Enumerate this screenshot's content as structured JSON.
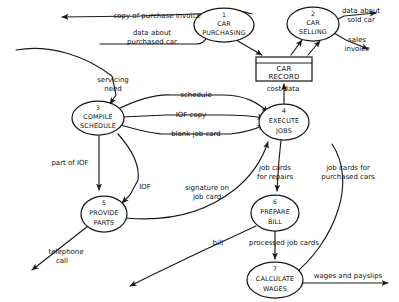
{
  "diagram": {
    "type": "data-flow-diagram",
    "background_color": "#ffffff",
    "ink_color": "#1a1a1a"
  },
  "processes": [
    {
      "id": "p1",
      "number": "1",
      "lines": [
        "CAR",
        "PURCHASING"
      ],
      "cx": 224,
      "cy": 25,
      "rx": 30,
      "ry": 17
    },
    {
      "id": "p2",
      "number": "2",
      "lines": [
        "CAR",
        "SELLING"
      ],
      "cx": 313,
      "cy": 24,
      "rx": 26,
      "ry": 17
    },
    {
      "id": "p3",
      "number": "3",
      "lines": [
        "COMPILE",
        "SCHEDULE"
      ],
      "cx": 98,
      "cy": 118,
      "rx": 26,
      "ry": 17
    },
    {
      "id": "p4",
      "number": "4",
      "lines": [
        "EXECUTE",
        "JOBS"
      ],
      "cx": 284,
      "cy": 122,
      "rx": 25,
      "ry": 18
    },
    {
      "id": "p5",
      "number": "5",
      "lines": [
        "PROVIDE",
        "PARTS"
      ],
      "cx": 104,
      "cy": 214,
      "rx": 23,
      "ry": 18
    },
    {
      "id": "p6",
      "number": "6",
      "lines": [
        "PREPARE",
        "BILL"
      ],
      "cx": 275,
      "cy": 213,
      "rx": 24,
      "ry": 18
    },
    {
      "id": "p7",
      "number": "7",
      "lines": [
        "CALCULATE",
        "WAGES"
      ],
      "cx": 275,
      "cy": 280,
      "rx": 28,
      "ry": 18
    }
  ],
  "datastores": [
    {
      "id": "d1",
      "name": "CAR RECORD",
      "lines": [
        "CAR",
        "RECORD"
      ],
      "x": 256,
      "y": 57,
      "width": 56,
      "height": 24
    }
  ],
  "flows": [
    {
      "id": "f1",
      "label": "copy of purchase invoice",
      "from": "p1",
      "to": "external-left",
      "label_x": 157,
      "label_y": 16
    },
    {
      "id": "f2",
      "label": "data about purchased car",
      "label_lines": [
        "data about",
        "purchased car"
      ],
      "from": "external-left",
      "to": "p1",
      "label_x": 152,
      "label_y": 38
    },
    {
      "id": "f3",
      "label": "data about sold car",
      "label_lines": [
        "data about",
        "sold car"
      ],
      "from": "p2",
      "to": "external-right",
      "label_x": 362,
      "label_y": 14
    },
    {
      "id": "f4",
      "label": "sales invoice",
      "label_lines": [
        "sales",
        "invoice"
      ],
      "from": "p2",
      "to": "external-right",
      "label_x": 358,
      "label_y": 44
    },
    {
      "id": "f5",
      "label": "servicing need",
      "label_lines": [
        "servicing",
        "need"
      ],
      "from": "external-left",
      "to": "p3",
      "label_x": 113,
      "label_y": 84
    },
    {
      "id": "f6",
      "label": "schedule",
      "from": "p3",
      "to": "p4",
      "label_x": 196,
      "label_y": 96
    },
    {
      "id": "f7",
      "label": "IOF copy",
      "from": "p3",
      "to": "p4",
      "label_x": 191,
      "label_y": 115
    },
    {
      "id": "f8",
      "label": "blank job card",
      "from": "p3",
      "to": "p4",
      "label_x": 195,
      "label_y": 133
    },
    {
      "id": "f9",
      "label": "cost data",
      "from": "p4",
      "to": "d1",
      "label_x": 283,
      "label_y": 90
    },
    {
      "id": "f10",
      "label": "part of IOF",
      "from": "p3",
      "to": "p5",
      "label_x": 75,
      "label_y": 163
    },
    {
      "id": "f11",
      "label": "IOF",
      "from": "p3",
      "to": "p5",
      "label_x": 143,
      "label_y": 187
    },
    {
      "id": "f12",
      "label": "signature on job card",
      "label_lines": [
        "signature on",
        "job card"
      ],
      "from": "p5",
      "to": "p4",
      "label_x": 205,
      "label_y": 192
    },
    {
      "id": "f13",
      "label": "telephone call",
      "label_lines": [
        "telephone",
        "call"
      ],
      "from": "p5",
      "to": "external-left",
      "label_x": 66,
      "label_y": 255
    },
    {
      "id": "f14",
      "label": "job cards for repairs",
      "label_lines": [
        "job cards",
        "for repairs"
      ],
      "from": "p4",
      "to": "p6",
      "label_x": 275,
      "label_y": 172
    },
    {
      "id": "f15",
      "label": "job cards for purchased cars",
      "label_lines": [
        "job cards for",
        "purchased cars"
      ],
      "from": "p4",
      "to": "p7",
      "label_x": 348,
      "label_y": 172
    },
    {
      "id": "f16",
      "label": "bill",
      "from": "p6",
      "to": "external-left",
      "label_x": 218,
      "label_y": 243
    },
    {
      "id": "f17",
      "label": "processed job cards",
      "from": "p6",
      "to": "p7",
      "label_x": 284,
      "label_y": 243
    },
    {
      "id": "f18",
      "label": "wages and payslips",
      "from": "p7",
      "to": "external-right",
      "label_x": 348,
      "label_y": 276
    }
  ]
}
